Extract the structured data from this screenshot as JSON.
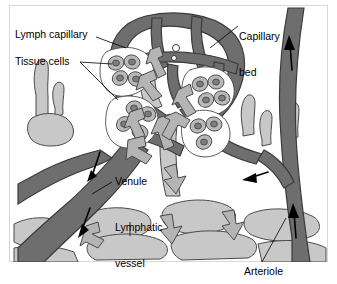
{
  "figure": {
    "type": "anatomical-diagram",
    "frame": {
      "border_color": "#d8d8d8",
      "background": "#ffffff"
    },
    "palette": {
      "blood_vessel_dark": "#6e6e6e",
      "lymph_vessel_light": "#c8c8c8",
      "fluid_arrow": "#b4b4b4",
      "cell_body": "#b9b9b9",
      "cell_nucleus": "#7d7d7d",
      "outline": "#3a3a3a",
      "flow_arrow": "#000000",
      "text": "#000000"
    },
    "labels": [
      {
        "id": "lymph-capillary",
        "text": "Lymph capillary",
        "lines": [
          "Lymph capillary"
        ]
      },
      {
        "id": "tissue-cells",
        "text": "Tissue cells",
        "lines": [
          "Tissue cells"
        ]
      },
      {
        "id": "capillary-bed",
        "text": "Capillary bed",
        "lines": [
          "Capillary",
          "bed"
        ]
      },
      {
        "id": "venule",
        "text": "Venule",
        "lines": [
          "Venule"
        ]
      },
      {
        "id": "lymphatic-vessel",
        "text": "Lymphatic vessel",
        "lines": [
          "Lymphatic",
          "vessel"
        ]
      },
      {
        "id": "arteriole",
        "text": "Arteriole",
        "lines": [
          "Arteriole"
        ]
      }
    ],
    "label_text": {
      "lymph_capillary": "Lymph capillary",
      "tissue_cells": "Tissue cells",
      "capillary_bed_line1": "Capillary",
      "capillary_bed_line2": "bed",
      "venule": "Venule",
      "lymphatic_line1": "Lymphatic",
      "lymphatic_line2": "vessel",
      "arteriole": "Arteriole"
    },
    "structures": {
      "capillary_bed": "dark-gray looped meshwork of capillaries at upper center",
      "lymph_capillary": "light-gray blind-ended lymphatic capillary branches at left",
      "venule": "thick dark-gray vessel branching to lower left with downward flow arrows",
      "arteriole": "dark-gray vessel along right edge with upward flow arrows",
      "lymphatic_vessel": "light-gray vessel network across lower area with block fluid arrows",
      "tissue_cells": "clusters of oval cells with nuclei in white interstitial spaces"
    },
    "flow_arrows": {
      "blood_black_arrows": 5,
      "interstitial_fluid_block_arrows": 9
    },
    "tissue_cell_clusters": 4
  }
}
